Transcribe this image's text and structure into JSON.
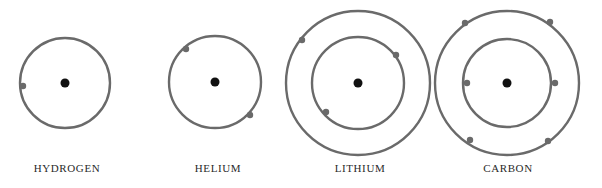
{
  "diagram": {
    "type": "bohr-atom-models",
    "colors": {
      "orbit": "#6a6a6a",
      "nucleus": "#111111",
      "electron": "#6a6a6a",
      "label": "#2a2a2a"
    },
    "atoms": [
      {
        "name": "HYDROGEN",
        "center": [
          65,
          83
        ],
        "nucleus_r": 4.5,
        "label_pos": [
          67,
          172
        ],
        "shells": [
          {
            "r": 45,
            "electrons": [
              [
                23,
                86
              ]
            ]
          }
        ]
      },
      {
        "name": "HELIUM",
        "center": [
          215,
          82
        ],
        "nucleus_r": 4.5,
        "label_pos": [
          218,
          172
        ],
        "shells": [
          {
            "r": 46,
            "electrons": [
              [
                186,
                49
              ],
              [
                250,
                115
              ]
            ]
          }
        ]
      },
      {
        "name": "LITHIUM",
        "center": [
          358,
          83
        ],
        "nucleus_r": 4.5,
        "label_pos": [
          360,
          172
        ],
        "shells": [
          {
            "r": 46,
            "electrons": [
              [
                396,
                55
              ],
              [
                326,
                112
              ]
            ]
          },
          {
            "r": 72,
            "electrons": [
              [
                302,
                40
              ]
            ]
          }
        ]
      },
      {
        "name": "CARBON",
        "center": [
          507,
          83
        ],
        "nucleus_r": 4.5,
        "label_pos": [
          508,
          172
        ],
        "shells": [
          {
            "r": 44,
            "electrons": [
              [
                467,
                83
              ],
              [
                555,
                83
              ]
            ]
          },
          {
            "r": 72,
            "electrons": [
              [
                465,
                23
              ],
              [
                550,
                22
              ],
              [
                470,
                140
              ],
              [
                548,
                141
              ]
            ]
          }
        ]
      }
    ]
  }
}
